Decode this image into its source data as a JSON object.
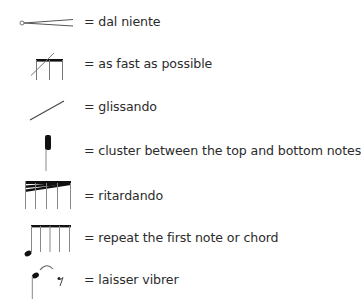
{
  "legend": {
    "items": [
      {
        "symbol": "dal-niente-hairpin",
        "text": "= dal niente"
      },
      {
        "symbol": "slashed-beam",
        "text": "= as fast as possible"
      },
      {
        "symbol": "glissando-line",
        "text": "= glissando"
      },
      {
        "symbol": "cluster-note",
        "text": "= cluster between the top and bottom notes"
      },
      {
        "symbol": "ritardando-feathered-beam",
        "text": "= ritardando"
      },
      {
        "symbol": "repeat-beam",
        "text": "= repeat the first note or chord"
      },
      {
        "symbol": "laisser-vibrer-tie",
        "text": "= laisser vibrer"
      }
    ]
  },
  "colors": {
    "text": "#2b2b2b",
    "symbol_line": "#777777",
    "symbol_fill": "#111111"
  }
}
